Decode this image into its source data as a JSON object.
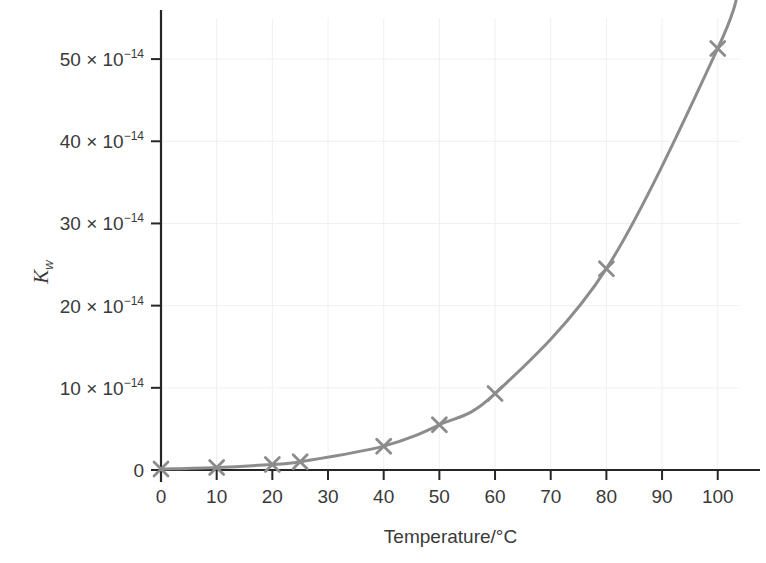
{
  "chart_data": {
    "type": "line",
    "title": "",
    "xlabel": "Temperature/°C",
    "ylabel": "Kw",
    "ylabel_base": "K",
    "ylabel_sub": "w",
    "y_scale_suffix": "× 10",
    "y_scale_exponent": "−14",
    "xlim": [
      0,
      104
    ],
    "ylim": [
      0,
      55
    ],
    "x": [
      0,
      10,
      20,
      25,
      40,
      50,
      60,
      80,
      100
    ],
    "values": [
      0.11,
      0.3,
      0.68,
      1.0,
      2.9,
      5.5,
      9.3,
      24.5,
      51.3
    ],
    "grid": true,
    "legend": "none",
    "series_color": "#8c8c8c",
    "axis_color": "#262626",
    "grid_color": "#f0f0f0",
    "marker": "x",
    "x_ticks": [
      {
        "value": 0,
        "label": "0"
      },
      {
        "value": 10,
        "label": "10"
      },
      {
        "value": 20,
        "label": "20"
      },
      {
        "value": 30,
        "label": "30"
      },
      {
        "value": 40,
        "label": "40"
      },
      {
        "value": 50,
        "label": "50"
      },
      {
        "value": 60,
        "label": "60"
      },
      {
        "value": 70,
        "label": "70"
      },
      {
        "value": 80,
        "label": "80"
      },
      {
        "value": 90,
        "label": "90"
      },
      {
        "value": 100,
        "label": "100"
      }
    ],
    "y_ticks": [
      {
        "value": 0,
        "label": "0",
        "mantissa": "0",
        "has_exponent": false
      },
      {
        "value": 10,
        "label": "10 × 10⁻¹⁴",
        "mantissa": "10",
        "has_exponent": true
      },
      {
        "value": 20,
        "label": "20 × 10⁻¹⁴",
        "mantissa": "20",
        "has_exponent": true
      },
      {
        "value": 30,
        "label": "30 × 10⁻¹⁴",
        "mantissa": "30",
        "has_exponent": true
      },
      {
        "value": 40,
        "label": "40 × 10⁻¹⁴",
        "mantissa": "40",
        "has_exponent": true
      },
      {
        "value": 50,
        "label": "50 × 10⁻¹⁴",
        "mantissa": "50",
        "has_exponent": true
      }
    ]
  }
}
